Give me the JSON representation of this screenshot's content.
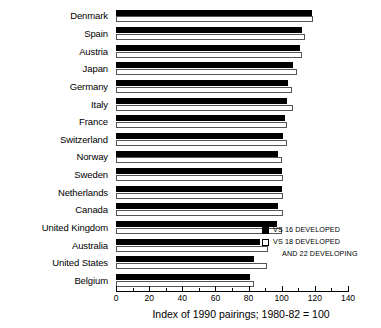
{
  "chart_data": {
    "type": "bar",
    "orientation": "horizontal",
    "title": "",
    "xlabel": "Index of 1990 pairings; 1980-82 = 100",
    "ylabel": "",
    "xlim": [
      0,
      140
    ],
    "xticks": [
      0,
      20,
      40,
      60,
      80,
      100,
      120,
      140
    ],
    "xtick_labels": [
      "0",
      "20",
      "40",
      "60",
      "80",
      "100",
      "120",
      "140"
    ],
    "grid": false,
    "legend_position": "right-lower",
    "categories": [
      "Denmark",
      "Spain",
      "Austria",
      "Japan",
      "Germany",
      "Italy",
      "France",
      "Switzerland",
      "Norway",
      "Sweden",
      "Netherlands",
      "Canada",
      "United Kingdom",
      "Australia",
      "United States",
      "Belgium"
    ],
    "series": [
      {
        "name": "VS 16 DEVELOPED",
        "color": "#000000",
        "fill": "solid",
        "values": [
          118,
          112,
          111,
          107,
          104,
          103,
          102,
          101,
          98,
          100,
          100,
          98,
          97,
          87,
          83,
          81
        ]
      },
      {
        "name": "VS 18 DEVELOPED AND 22 DEVELOPING",
        "color": "#ffffff",
        "fill": "open",
        "values": [
          119,
          114,
          112,
          109,
          106,
          107,
          103,
          103,
          100,
          101,
          101,
          101,
          100,
          92,
          91,
          83
        ]
      }
    ]
  },
  "legend": {
    "items": [
      {
        "label": "VS 16 DEVELOPED",
        "label_line2": "",
        "swatch": "black"
      },
      {
        "label": "VS 18 DEVELOPED",
        "label_line2": "AND 22 DEVELOPING",
        "swatch": "white"
      }
    ]
  },
  "axis": {
    "caption": "Index of 1990 pairings; 1980-82 = 100"
  }
}
